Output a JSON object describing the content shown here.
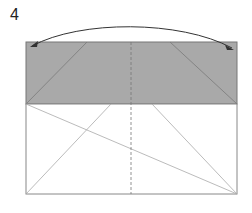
{
  "step": {
    "number": "4"
  },
  "diagram": {
    "colors": {
      "shaded": "#a9a9a9",
      "outline": "#777777",
      "crease": "#9a9a9a",
      "arrow": "#333333"
    }
  }
}
